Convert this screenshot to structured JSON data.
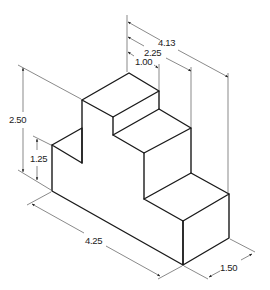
{
  "drawing": {
    "type": "isometric stepped block",
    "colors": {
      "object_line": "#1a1a1a",
      "dimension_line": "#3a3a3a",
      "background": "#ffffff"
    },
    "dimensions": {
      "overall_length": "4.25",
      "overall_height": "2.50",
      "lower_height": "1.25",
      "depth": "1.50",
      "step_1": "1.00",
      "step_2": "2.25",
      "step_3": "4.13"
    }
  }
}
